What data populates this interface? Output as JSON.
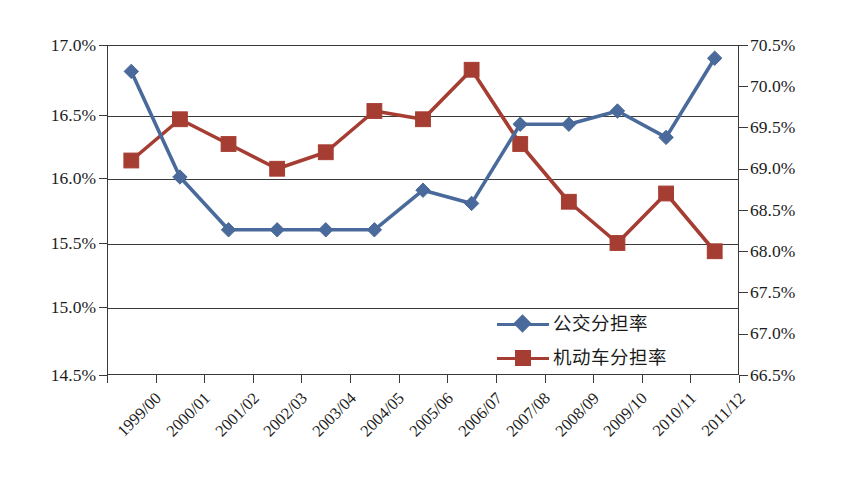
{
  "chart_data": {
    "type": "line",
    "title": "",
    "xlabel": "",
    "categories": [
      "1999/00",
      "2000/01",
      "2001/02",
      "2002/03",
      "2003/04",
      "2004/05",
      "2005/06",
      "2006/07",
      "2007/08",
      "2008/09",
      "2009/10",
      "2010/11",
      "2011/12"
    ],
    "series": [
      {
        "name": "公交分担率",
        "axis": "left",
        "color": "#4A6A9B",
        "marker": "diamond",
        "values": [
          16.8,
          16.0,
          15.6,
          15.6,
          15.6,
          15.6,
          15.9,
          15.8,
          16.4,
          16.4,
          16.5,
          16.3,
          16.9
        ]
      },
      {
        "name": "机动车分担率",
        "axis": "right",
        "color": "#A63D32",
        "marker": "square",
        "values": [
          69.1,
          69.6,
          69.3,
          69.0,
          69.2,
          69.7,
          69.6,
          70.2,
          69.3,
          68.6,
          68.1,
          68.7,
          68.0
        ]
      }
    ],
    "left_axis": {
      "ylabel": "",
      "ylim": [
        14.5,
        17.0
      ],
      "tick_step": 0.5,
      "ticks": [
        "14.5%",
        "15.0%",
        "15.5%",
        "16.0%",
        "16.5%",
        "17.0%"
      ],
      "tick_values": [
        14.5,
        15.0,
        15.5,
        16.0,
        16.5,
        17.0
      ]
    },
    "right_axis": {
      "ylabel": "",
      "ylim": [
        66.5,
        70.5
      ],
      "tick_step": 0.5,
      "ticks": [
        "66.5%",
        "67.0%",
        "67.5%",
        "68.0%",
        "68.5%",
        "69.0%",
        "69.5%",
        "70.0%",
        "70.5%"
      ],
      "tick_values": [
        66.5,
        67.0,
        67.5,
        68.0,
        68.5,
        69.0,
        69.5,
        70.0,
        70.5
      ]
    },
    "grid": {
      "horizontal": true,
      "vertical": false,
      "gridline_values_left": [
        15.0,
        15.5,
        16.0,
        16.5
      ]
    },
    "legend": {
      "position": "inside-bottom-right",
      "entries": [
        {
          "label": "公交分担率",
          "color": "#4A6A9B",
          "marker": "diamond"
        },
        {
          "label": "机动车分担率",
          "color": "#A63D32",
          "marker": "square"
        }
      ]
    },
    "frame_color": "#3A3A3A",
    "background": "#FFFFFF"
  }
}
